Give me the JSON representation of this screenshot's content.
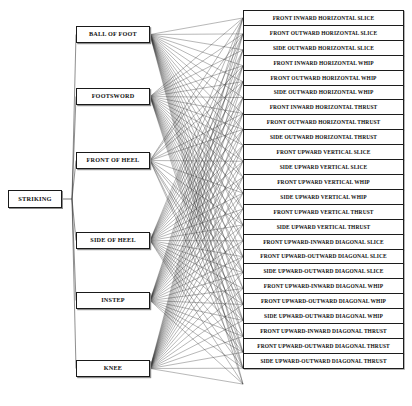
{
  "diagram": {
    "type": "tree-diagram",
    "title": "STRIKING",
    "orientation": "left-to-right",
    "background_color": "#ffffff",
    "line_color": "#303030",
    "box_border_color": "#1a1a1a",
    "root": {
      "label": "STRIKING",
      "x": 8,
      "y": 190,
      "w": 54,
      "h": 18
    },
    "mid_nodes": [
      {
        "id": "ball-of-foot",
        "label": "BALL OF FOOT",
        "x": 76,
        "y": 26,
        "w": 74,
        "h": 17
      },
      {
        "id": "footsword",
        "label": "FOOTSWORD",
        "x": 76,
        "y": 88,
        "w": 74,
        "h": 17
      },
      {
        "id": "front-of-heel",
        "label": "FRONT OF HEEL",
        "x": 76,
        "y": 152,
        "w": 74,
        "h": 17
      },
      {
        "id": "side-of-heel",
        "label": "SIDE OF HEEL",
        "x": 76,
        "y": 232,
        "w": 74,
        "h": 17
      },
      {
        "id": "instep",
        "label": "INSTEP",
        "x": 76,
        "y": 292,
        "w": 74,
        "h": 17
      },
      {
        "id": "knee",
        "label": "KNEE",
        "x": 76,
        "y": 360,
        "w": 74,
        "h": 17
      }
    ],
    "leaf_nodes": [
      {
        "id": "l1",
        "label": "FRONT INWARD HORIZONTAL SLICE"
      },
      {
        "id": "l2",
        "label": "FRONT OUTWARD HORIZONTAL SLICE"
      },
      {
        "id": "l3",
        "label": "SIDE OUTWARD HORIZONTAL SLICE"
      },
      {
        "id": "l4",
        "label": "FRONT INWARD HORIZONTAL WHIP"
      },
      {
        "id": "l5",
        "label": "FRONT OUTWARD HORIZONTAL WHIP"
      },
      {
        "id": "l6",
        "label": "SIDE OUTWARD HORIZONTAL WHIP"
      },
      {
        "id": "l7",
        "label": "FRONT INWARD HORIZONTAL THRUST"
      },
      {
        "id": "l8",
        "label": "FRONT OUTWARD HORIZONTAL THRUST"
      },
      {
        "id": "l9",
        "label": "SIDE OUTWARD HORIZONTAL THRUST"
      },
      {
        "id": "l10",
        "label": "FRONT UPWARD VERTICAL SLICE"
      },
      {
        "id": "l11",
        "label": "SIDE UPWARD VERTICAL SLICE"
      },
      {
        "id": "l12",
        "label": "FRONT UPWARD VERTICAL WHIP"
      },
      {
        "id": "l13",
        "label": "SIDE UPWARD VERTICAL WHIP"
      },
      {
        "id": "l14",
        "label": "FRONT UPWARD VERTICAL THRUST"
      },
      {
        "id": "l15",
        "label": "SIDE UPWARD VERTICAL THRUST"
      },
      {
        "id": "l16",
        "label": "FRONT UPWARD-INWARD DIAGONAL SLICE"
      },
      {
        "id": "l17",
        "label": "FRONT UPWARD-OUTWARD DIAGONAL SLICE"
      },
      {
        "id": "l18",
        "label": "SIDE UPWARD-OUTWARD DIAGONAL SLICE"
      },
      {
        "id": "l19",
        "label": "FRONT UPWARD-INWARD DIAGONAL WHIP"
      },
      {
        "id": "l20",
        "label": "FRONT UPWARD-OUTWARD DIAGONAL WHIP"
      },
      {
        "id": "l21",
        "label": "SIDE UPWARD-OUTWARD DIAGONAL WHIP"
      },
      {
        "id": "l22",
        "label": "FRONT UPWARD-INWARD DIAGONAL THRUST"
      },
      {
        "id": "l23",
        "label": "FRONT UPWARD-OUTWARD DIAGONAL THRUST"
      },
      {
        "id": "l24",
        "label": "SIDE UPWARD-OUTWARD DIAGONAL THRUST"
      }
    ],
    "leaf_column": {
      "x": 243,
      "y": 10,
      "w": 161,
      "row_h": 15.92,
      "count": 24
    },
    "edges_root_to_mid": [
      "ball-of-foot",
      "footsword",
      "front-of-heel",
      "side-of-heel",
      "instep",
      "knee"
    ],
    "edges_mid_to_leaf": {
      "ball-of-foot": [
        1,
        2,
        3,
        4,
        5,
        6,
        7,
        8,
        9,
        10,
        11,
        12,
        13,
        14,
        15,
        16,
        17,
        18,
        19,
        20,
        21,
        22,
        23,
        24
      ],
      "footsword": [
        1,
        2,
        3,
        4,
        5,
        6,
        7,
        8,
        9,
        10,
        11,
        12,
        13,
        14,
        15,
        16,
        17,
        18,
        19,
        20,
        21,
        22,
        23,
        24
      ],
      "front-of-heel": [
        1,
        2,
        4,
        5,
        7,
        8,
        10,
        12,
        14,
        16,
        17,
        19,
        20,
        22,
        23
      ],
      "side-of-heel": [
        1,
        2,
        3,
        4,
        5,
        6,
        7,
        8,
        9,
        10,
        11,
        12,
        13,
        14,
        15,
        16,
        17,
        18,
        19,
        20,
        21,
        22,
        23,
        24
      ],
      "instep": [
        1,
        2,
        3,
        4,
        5,
        6,
        7,
        8,
        9,
        10,
        11,
        12,
        13,
        14,
        15,
        16,
        17,
        18,
        19,
        20,
        21,
        22,
        23,
        24
      ],
      "knee": [
        1,
        2,
        3,
        4,
        5,
        6,
        7,
        8,
        9,
        10,
        11,
        12,
        13,
        14,
        15,
        16,
        17,
        18,
        19,
        20,
        21,
        22,
        23,
        24
      ]
    }
  }
}
